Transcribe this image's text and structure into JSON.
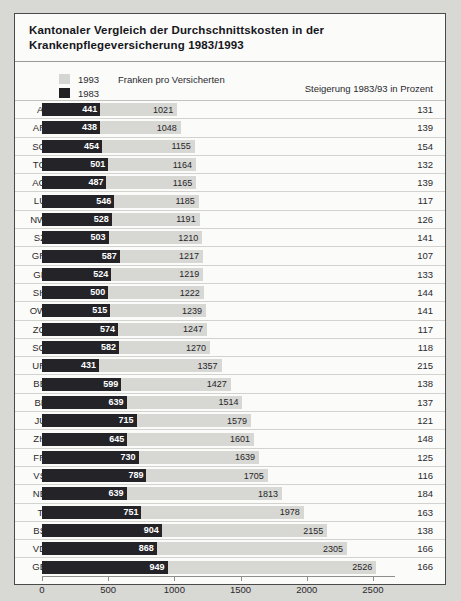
{
  "title": {
    "line1": "Kantonaler Vergleich der Durchschnittskosten in der",
    "line2": "Krankenpflegeversicherung 1983/1993"
  },
  "legend": {
    "series_1993_label": "1993",
    "series_1993_swatch": "light-gray-swatch-icon",
    "series_1983_label": "1983",
    "series_1983_swatch": "dark-swatch-icon",
    "unit_note": "Franken pro Versicherten",
    "right_note": "Steigerung 1983/93 in Prozent"
  },
  "colors": {
    "series_1993": "#d7d7d3",
    "series_1983": "#242428",
    "page_background": "#d8d8d4",
    "panel_background": "#fbfbfa",
    "border": "#4a4a4a"
  },
  "chart_data": {
    "type": "bar",
    "orientation": "horizontal",
    "title": "Kantonaler Vergleich der Durchschnittskosten in der Krankenpflegeversicherung 1983/1993",
    "xlabel": "Franken pro Versicherten",
    "ylabel": "",
    "xlim": [
      0,
      2700
    ],
    "xticks": [
      0,
      500,
      1000,
      1500,
      2000,
      2500
    ],
    "xtick_labels": [
      "0",
      "500",
      "1000",
      "1500",
      "2000",
      "2500"
    ],
    "grid": false,
    "legend_position": "top-left",
    "categories": [
      "AI",
      "AR",
      "SG",
      "TG",
      "AG",
      "LU",
      "NW",
      "SZ",
      "GR",
      "GL",
      "SH",
      "OW",
      "ZG",
      "SO",
      "UR",
      "BE",
      "BL",
      "JU",
      "ZH",
      "FR",
      "VS",
      "NE",
      "TI",
      "BS",
      "VD",
      "GE"
    ],
    "series": [
      {
        "name": "1993",
        "values": [
          1021,
          1048,
          1155,
          1164,
          1165,
          1185,
          1191,
          1210,
          1217,
          1219,
          1222,
          1239,
          1247,
          1270,
          1357,
          1427,
          1514,
          1579,
          1601,
          1639,
          1705,
          1813,
          1978,
          2155,
          2305,
          2526
        ]
      },
      {
        "name": "1983",
        "values": [
          441,
          438,
          454,
          501,
          487,
          546,
          528,
          503,
          587,
          524,
          500,
          515,
          574,
          582,
          431,
          599,
          639,
          715,
          645,
          730,
          789,
          639,
          751,
          904,
          868,
          949
        ]
      }
    ],
    "extra_column": {
      "name": "Steigerung 1983/93 in Prozent",
      "values": [
        131,
        139,
        154,
        132,
        139,
        117,
        126,
        141,
        107,
        133,
        144,
        141,
        117,
        118,
        215,
        138,
        137,
        121,
        148,
        125,
        116,
        184,
        163,
        138,
        166,
        166
      ]
    }
  }
}
